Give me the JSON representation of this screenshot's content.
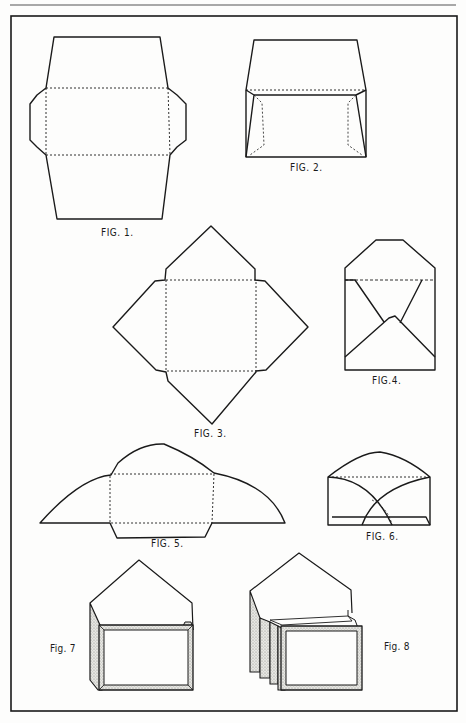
{
  "figures": [
    {
      "id": "fig1",
      "label": "FIG. 1.",
      "description": "Flat envelope blank with side flaps, dotted fold lines"
    },
    {
      "id": "fig2",
      "label": "FIG. 2.",
      "description": "Envelope folded with open top flap"
    },
    {
      "id": "fig3",
      "label": "FIG. 3.",
      "description": "Square diamond envelope blank with four pointed flaps"
    },
    {
      "id": "fig4",
      "label": "FIG.4.",
      "description": "Folded square envelope with pointed flap open"
    },
    {
      "id": "fig5",
      "label": "FIG. 5.",
      "description": "Envelope blank with curved side flaps"
    },
    {
      "id": "fig6",
      "label": "FIG. 6.",
      "description": "Folded envelope with curved overlapping flaps"
    },
    {
      "id": "fig7",
      "label": "Fig. 7",
      "description": "Envelope with framed card inserted"
    },
    {
      "id": "fig8",
      "label": "Fig. 8",
      "description": "Envelope with stacked framed cards inserted"
    }
  ],
  "colors": {
    "ink": "#1a1a1a",
    "paper": "#fdfdfc",
    "stipple": "#c8c8c4"
  }
}
